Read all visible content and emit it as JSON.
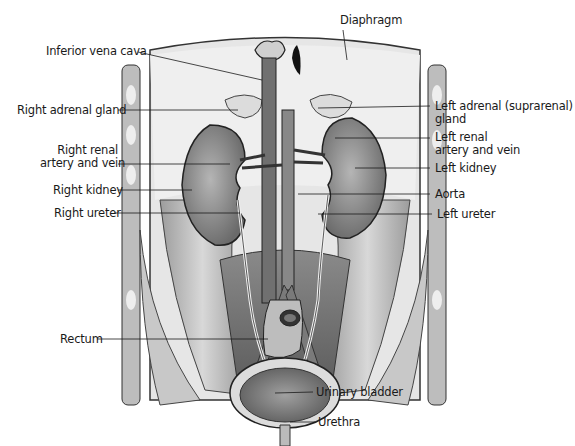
{
  "figure": {
    "type": "anatomical-illustration",
    "labels": {
      "diaphragm": "Diaphragm",
      "inferior_vena_cava": "Inferior vena cava",
      "right_adrenal_gland": "Right adrenal gland",
      "left_adrenal_gland_line1": "Left adrenal (suprarenal)",
      "left_adrenal_gland_line2": "gland",
      "right_renal_line1": "Right renal",
      "right_renal_line2": "artery and vein",
      "left_renal_line1": "Left renal",
      "left_renal_line2": "artery and vein",
      "right_kidney": "Right kidney",
      "left_kidney": "Left kidney",
      "aorta": "Aorta",
      "right_ureter": "Right ureter",
      "left_ureter": "Left ureter",
      "rectum": "Rectum",
      "urinary_bladder": "Urinary bladder",
      "urethra": "Urethra"
    },
    "colors": {
      "background": "#ffffff",
      "tissue_light": "#d9d9d9",
      "tissue_mid": "#a8a8a8",
      "tissue_dark": "#6e6e6e",
      "outline": "#2a2a2a",
      "label_text": "#1a1a1a"
    }
  }
}
